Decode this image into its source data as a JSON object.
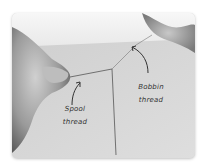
{
  "image": {
    "subject": "hands holding two threads on a sewing surface",
    "annotations": [
      {
        "id": "spool",
        "lines": [
          "Spool",
          "thread"
        ]
      },
      {
        "id": "bobbin",
        "lines": [
          "Bobbin",
          "thread"
        ]
      }
    ]
  },
  "colors": {
    "background": "#ffffff",
    "fabric": "#d4d4d4",
    "wall": "#f2f2f2",
    "skin": "#a8a8a8",
    "ink": "#333333"
  }
}
